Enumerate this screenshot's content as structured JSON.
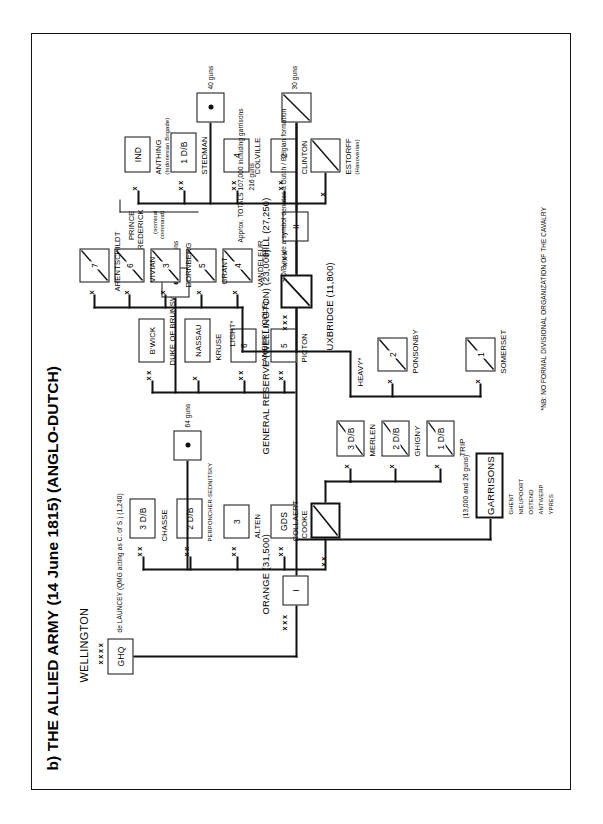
{
  "title": "b) THE ALLIED ARMY (14 June 1815) (ANGLO-DUTCH)",
  "commander": {
    "name": "WELLINGTON",
    "echelon": "xxxx",
    "hq_box": "GHQ",
    "staff_note": "de LAUNCEY (QMG acting as C. of S.) (1,240)"
  },
  "totals_note": "Approx. TOTALS  107,000 including garrisons\n216 guns",
  "totals_line1": "Approx. TOTALS  107,000 including garrisons",
  "totals_line2": "216 guns",
  "footnotes": {
    "cavalry": "*NB: NO FORMAL DIVISIONAL ORGANIZATION OF THE CAVALRY",
    "dutch_belgian": "+ D/B inside a symbol denotes a Dutch / Belgian formation"
  },
  "corps": [
    {
      "id": "i-corps",
      "echelon": "xxx",
      "box": "I",
      "header": "ORANGE (31,500)",
      "divisions": [
        {
          "echelon": "xx",
          "box": "GDS",
          "name": "COOKE",
          "dagger": false
        },
        {
          "echelon": "xx",
          "box": "3",
          "name": "ALTEN",
          "dagger": false
        },
        {
          "echelon": "xx",
          "box": "2 D/B",
          "name": "PERPONCHER-SEDNITSKY",
          "dagger": true
        },
        {
          "echelon": "xx",
          "box": "3 D/B",
          "name": "CHASSE",
          "dagger": true
        }
      ],
      "artillery": {
        "symbol": "dot",
        "label": "64 guns"
      },
      "cavalry": {
        "echelon": "xx",
        "name": "COLLAERT",
        "brigades": [
          {
            "echelon": "x",
            "box": "1 D/B",
            "name": "TRIP",
            "dagger": true
          },
          {
            "echelon": "x",
            "box": "2 D/B",
            "name": "GHIGNY",
            "dagger": true
          },
          {
            "echelon": "x",
            "box": "3 D/B",
            "name": "MERLEN",
            "dagger": true
          }
        ]
      }
    },
    {
      "id": "ii-corps",
      "echelon": "xxx",
      "box": "II",
      "header": "HILL (27,250)",
      "divisions": [
        {
          "echelon": "xx",
          "box": "2",
          "name": "CLINTON",
          "dagger": false
        },
        {
          "echelon": "xx",
          "box": "4",
          "name": "COLVILLE",
          "dagger": false
        },
        {
          "echelon": "xx",
          "box": "1 D/B",
          "name": "STEDMAN",
          "dagger": true
        },
        {
          "echelon": "x",
          "box": "IND",
          "name": "ANTHING",
          "subname": "(Indonesian Brigade)",
          "dagger": false
        }
      ],
      "brace_label_line1": "PRINCE FREDERICK",
      "brace_label_line2": "(nominal command)",
      "artillery": {
        "symbol": "dot",
        "label": "40 guns"
      },
      "cavalry": {
        "echelon": "x",
        "name": "ESTORFF",
        "subname": "(Hanoverian)"
      }
    }
  ],
  "reserve": {
    "id": "general-reserve",
    "header": "GENERAL RESERVE (WELLINGTON) (23,000)",
    "divisions": [
      {
        "echelon": "xx",
        "box": "5",
        "name": "PICTON",
        "dagger": false
      },
      {
        "echelon": "xx",
        "box": "6",
        "name": "LAMBERT (COLE)",
        "dagger": false
      },
      {
        "echelon": "x",
        "box": "NASSAU",
        "name": "KRUSE",
        "dagger": false
      },
      {
        "echelon": "xx",
        "box": "B'WICK",
        "name": "DUKE OF BRUNSWICK",
        "dagger": false
      }
    ],
    "artillery": {
      "symbol": "dot",
      "label": "56 guns"
    }
  },
  "cavalry_corps": {
    "id": "cavalry-corps",
    "echelon": "xxx",
    "header": "UXBRIDGE (11,800)",
    "subheader": "(13,000 and 26 guns)",
    "artillery": {
      "label": "30 guns"
    },
    "heavy": {
      "label": "HEAVY*",
      "brigades": [
        {
          "echelon": "x",
          "box": "1",
          "name": "SOMERSET"
        },
        {
          "echelon": "x",
          "box": "2",
          "name": "PONSONBY"
        }
      ]
    },
    "light": {
      "label": "LIGHT*",
      "brigades": [
        {
          "echelon": "x",
          "box": "4",
          "name": "VANDELEUR"
        },
        {
          "echelon": "x",
          "box": "5",
          "name": "GRANT"
        },
        {
          "echelon": "x",
          "box": "3",
          "name": "DORNBERG"
        },
        {
          "echelon": "x",
          "box": "6",
          "name": "VIVIAN"
        },
        {
          "echelon": "x",
          "box": "7",
          "name": "ARENTSCHILDT"
        }
      ]
    }
  },
  "garrisons": {
    "box": "GARRISONS",
    "strength": "(13,000 and 26 guns)",
    "places": [
      "GHENT",
      "NIEUPOORT",
      "OSTEND",
      "ANTWERP",
      "YPRES"
    ]
  }
}
